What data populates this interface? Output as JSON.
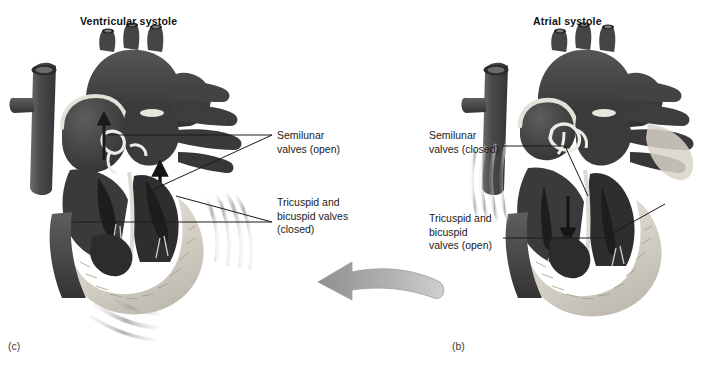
{
  "figure": {
    "background_color": "#ffffff",
    "leader_line_color": "#1a1a1a",
    "transition_arrow": {
      "name": "cycle-arrow",
      "direction": "right-to-left",
      "color": "#a6a6a6",
      "meaning": "atrial systole precedes ventricular systole"
    }
  },
  "panels": [
    {
      "id": "ventricular-systole",
      "title": "Ventricular systole",
      "caption": "(c)",
      "motion_lines": "contraction lines at ventricular wall and apex",
      "labels": [
        {
          "id": "semilunar-open",
          "line1": "Semilunar",
          "line2": "valves (open)",
          "text": "Semilunar\nvalves (open)"
        },
        {
          "id": "tricuspid-closed",
          "line1": "Tricuspid and",
          "line2": "bicuspid valves",
          "line3": "(closed)",
          "text": "Tricuspid and\nbicuspid valves\n(closed)"
        }
      ]
    },
    {
      "id": "atrial-systole",
      "title": "Atrial systole",
      "caption": "(b)",
      "motion_lines": "contraction lines at atrial wall",
      "labels": [
        {
          "id": "semilunar-closed",
          "line1": "Semilunar",
          "line2": "valves (closed)",
          "text": "Semilunar\nvalves (closed)"
        },
        {
          "id": "tricuspid-open",
          "line1": "Tricuspid and",
          "line2": "bicuspid",
          "line3": "valves (open)",
          "text": "Tricuspid and\nbicuspid\nvalves (open)"
        }
      ]
    }
  ],
  "palette": {
    "vessel_dark": "#4a4a4a",
    "vessel_darker": "#3a3a3a",
    "chamber_dark": "#343434",
    "chamber_mid": "#5c5c5c",
    "myocardium_light": "#dcd9d2",
    "valve_outline": "#e8e6e0",
    "motion_gray": "#b9b9b9",
    "arrow_gray": "#a6a6a6",
    "text": "#1a1a1a"
  }
}
